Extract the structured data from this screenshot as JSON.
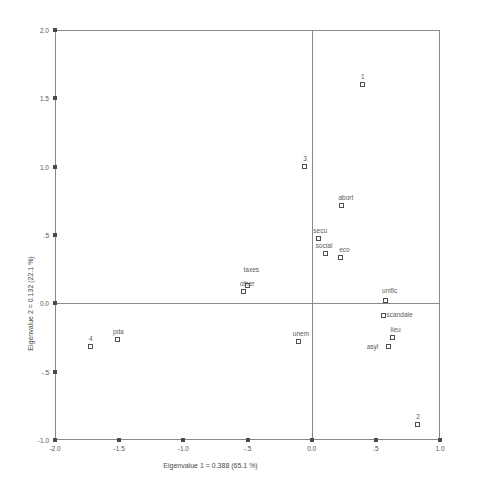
{
  "chart_data": {
    "type": "scatter",
    "title": "",
    "xlabel": "Eigenvalue 1 = 0.388 (65.1 %)",
    "ylabel": "Eigenvalue 2 = 0.132 (22.1 %)",
    "xlim": [
      -2.0,
      1.0
    ],
    "ylim": [
      -1.0,
      2.0
    ],
    "grid": false,
    "legend": "none",
    "xticks": [
      "-2.0",
      "-1.5",
      "-1.0",
      "-.5",
      "0.0",
      ".5",
      "1.0"
    ],
    "xtickvalues": [
      -2.0,
      -1.5,
      -1.0,
      -0.5,
      0.0,
      0.5,
      1.0
    ],
    "yticks": [
      "2.0",
      "1.5",
      "1.0",
      ".5",
      "0.0",
      "-.5",
      "-1.0"
    ],
    "ytickvalues": [
      2.0,
      1.5,
      1.0,
      0.5,
      0.0,
      -0.5,
      -1.0
    ],
    "reference_lines": {
      "x": 0.0,
      "y": 0.0
    },
    "marker_style": "open-square",
    "points": [
      {
        "label": "1",
        "x": 0.4,
        "y": 1.6,
        "lx": -2,
        "ly": -12
      },
      {
        "label": "3",
        "x": -0.05,
        "y": 1.0,
        "lx": -2,
        "ly": -12
      },
      {
        "label": "abort",
        "x": 0.24,
        "y": 0.71,
        "lx": -4,
        "ly": -12
      },
      {
        "label": "secu",
        "x": 0.06,
        "y": 0.47,
        "lx": -6,
        "ly": -12
      },
      {
        "label": "social",
        "x": 0.11,
        "y": 0.36,
        "lx": -10,
        "ly": -12
      },
      {
        "label": "eco",
        "x": 0.23,
        "y": 0.33,
        "lx": -2,
        "ly": -12
      },
      {
        "label": "taxes",
        "x": -0.5,
        "y": 0.13,
        "lx": -4,
        "ly": -20
      },
      {
        "label": "other",
        "x": -0.53,
        "y": 0.08,
        "lx": -4,
        "ly": -12
      },
      {
        "label": "unific",
        "x": 0.58,
        "y": 0.02,
        "lx": -4,
        "ly": -14
      },
      {
        "label": "scandale",
        "x": 0.56,
        "y": -0.09,
        "lx": 3,
        "ly": -5
      },
      {
        "label": "unem",
        "x": -0.1,
        "y": -0.28,
        "lx": -6,
        "ly": -12
      },
      {
        "label": "lieu",
        "x": 0.63,
        "y": -0.25,
        "lx": -2,
        "ly": -12
      },
      {
        "label": "asyl",
        "x": 0.6,
        "y": -0.32,
        "lx": -22,
        "ly": -4
      },
      {
        "label": "pda",
        "x": -1.51,
        "y": -0.27,
        "lx": -5,
        "ly": -12
      },
      {
        "label": "4",
        "x": -1.72,
        "y": -0.32,
        "lx": -2,
        "ly": -12
      },
      {
        "label": "2",
        "x": 0.83,
        "y": -0.89,
        "lx": -2,
        "ly": -12
      }
    ]
  }
}
